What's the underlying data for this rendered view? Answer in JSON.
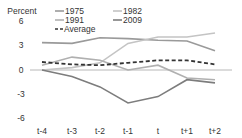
{
  "chart_data": {
    "type": "line",
    "title": "",
    "ylabel": "Percent",
    "xlabel": "",
    "categories": [
      "t-4",
      "t-3",
      "t-2",
      "t-1",
      "t",
      "t+1",
      "t+2"
    ],
    "ylim": [
      -6,
      6
    ],
    "yticks": [
      6,
      3,
      0,
      -3,
      -6
    ],
    "ytick_labels": [
      "6",
      "3",
      "0",
      "-3",
      "-6"
    ],
    "grid": false,
    "zero_line": true,
    "legend_position": "top",
    "series": [
      {
        "name": "1975",
        "color": "#9a9a9a",
        "dash": "solid",
        "values": [
          3.4,
          3.3,
          4.0,
          3.9,
          3.7,
          3.6,
          2.4
        ]
      },
      {
        "name": "1982",
        "color": "#c4c4c4",
        "dash": "solid",
        "values": [
          0.0,
          0.3,
          0.9,
          3.3,
          4.1,
          4.1,
          4.6
        ]
      },
      {
        "name": "1991",
        "color": "#b0b0b0",
        "dash": "solid",
        "values": [
          0.6,
          1.6,
          1.2,
          0.0,
          0.6,
          -1.0,
          -1.2
        ]
      },
      {
        "name": "2009",
        "color": "#7d7d7d",
        "dash": "solid",
        "values": [
          0.0,
          -0.8,
          -2.1,
          -4.1,
          -3.3,
          -1.2,
          -1.6
        ]
      },
      {
        "name": "Average",
        "color": "#333333",
        "dash": "dashed",
        "values": [
          1.0,
          0.7,
          0.6,
          0.9,
          1.2,
          1.2,
          0.7
        ]
      }
    ]
  },
  "axis": {
    "y_title": "Percent",
    "y_labels": [
      "6",
      "3",
      "0",
      "-3",
      "-6"
    ],
    "x_labels": [
      "t-4",
      "t-3",
      "t-2",
      "t-1",
      "t",
      "t+1",
      "t+2"
    ]
  },
  "legend": {
    "items": [
      {
        "label": "1975",
        "color": "#9a9a9a"
      },
      {
        "label": "1982",
        "color": "#c4c4c4"
      },
      {
        "label": "1991",
        "color": "#b0b0b0"
      },
      {
        "label": "2009",
        "color": "#7d7d7d"
      },
      {
        "label": "Average",
        "color": "#333333"
      }
    ]
  }
}
